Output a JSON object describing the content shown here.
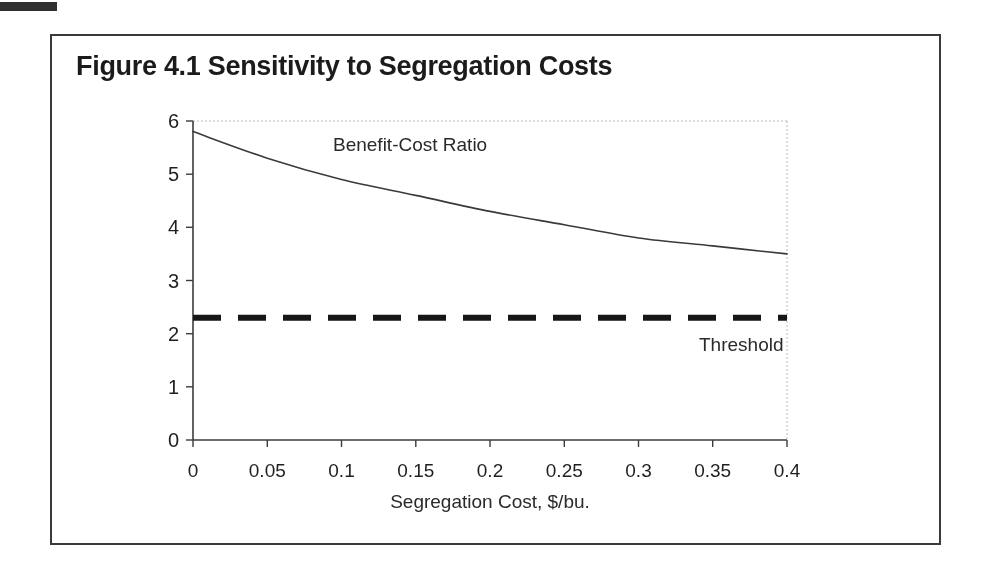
{
  "figure": {
    "title": "Figure 4.1 Sensitivity to Segregation Costs"
  },
  "chart_data": {
    "type": "line",
    "title": "Figure 4.1 Sensitivity to Segregation Costs",
    "xlabel": "Segregation Cost, $/bu.",
    "ylabel": "",
    "xlim": [
      0,
      0.4
    ],
    "ylim": [
      0,
      6
    ],
    "grid": false,
    "legend_position": "inline-annotations",
    "x_tick_values": [
      0,
      0.05,
      0.1,
      0.15,
      0.2,
      0.25,
      0.3,
      0.35,
      0.4
    ],
    "x_tick_labels": [
      "0",
      "0.05",
      "0.1",
      "0.15",
      "0.2",
      "0.25",
      "0.3",
      "0.35",
      "0.4"
    ],
    "y_tick_values": [
      0,
      1,
      2,
      3,
      4,
      5,
      6
    ],
    "y_tick_labels": [
      "0",
      "1",
      "2",
      "3",
      "4",
      "5",
      "6"
    ],
    "series": [
      {
        "name": "Benefit-Cost Ratio",
        "line_style": "solid",
        "line_width": 1.6,
        "x": [
          0,
          0.05,
          0.1,
          0.15,
          0.2,
          0.25,
          0.3,
          0.35,
          0.4
        ],
        "values": [
          5.8,
          5.3,
          4.9,
          4.6,
          4.3,
          4.05,
          3.8,
          3.65,
          3.5
        ]
      },
      {
        "name": "Threshold",
        "line_style": "dashed",
        "line_width": 6,
        "x": [
          0,
          0.4
        ],
        "values": [
          2.3,
          2.3
        ]
      }
    ],
    "annotations": [
      {
        "text": "Benefit-Cost Ratio",
        "x": 0.095,
        "y": 5.55
      },
      {
        "text": "Threshold",
        "x": 0.34,
        "y": 1.95
      }
    ]
  },
  "labels": {
    "series_benefit_cost": "Benefit-Cost Ratio",
    "series_threshold": "Threshold",
    "x_axis_title": "Segregation Cost, $/bu."
  },
  "colors": {
    "ink": "#1f1f1f",
    "axis": "#3c3c3c",
    "curve": "#3a3a3a",
    "threshold": "#161616",
    "plot_border": "#b9b9b9",
    "frame_border": "#3a3a3a",
    "background": "#ffffff"
  }
}
